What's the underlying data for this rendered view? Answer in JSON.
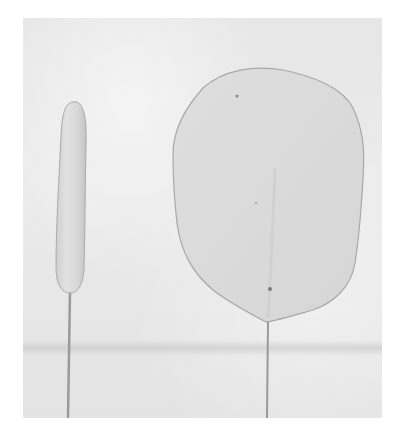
{
  "image": {
    "description": "Black-and-white photograph of two sugar-paste leaf shapes on wires against a textured light background",
    "objects": [
      {
        "name": "elongated-paste-sausage-on-wire",
        "shape": "elongated rounded rod"
      },
      {
        "name": "flattened-oval-leaf-on-wire",
        "shape": "flat rounded oval petal"
      }
    ],
    "colors": {
      "background_paper": "#ffffff",
      "backdrop": "#e8e8e8",
      "paste": "#dcdcdc",
      "outline": "#a8a8a8",
      "wire": "#9a9a9a"
    }
  }
}
